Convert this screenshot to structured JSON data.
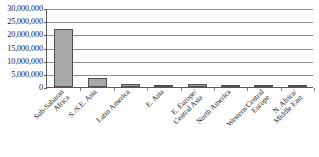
{
  "chart_data": {
    "type": "bar",
    "title": "",
    "subtitle": "",
    "xlabel": "",
    "ylabel": "",
    "categories": [
      "Sub-Saharan Africa",
      "S./S.E. Asia",
      "Latin America",
      "E. Asia",
      "E. Europe/ Central Asia",
      "North America",
      "Western/Central Europe",
      "N. Africa/ Middle East"
    ],
    "category_lines": [
      [
        "Sub-Saharan",
        "Africa"
      ],
      [
        "S./S.E. Asia"
      ],
      [
        "Latin America"
      ],
      [
        "E. Asia"
      ],
      [
        "E. Europe/",
        "Central Asia"
      ],
      [
        "North America"
      ],
      [
        "Western/Central",
        "Europe"
      ],
      [
        "N. Africa/",
        "Middle East"
      ]
    ],
    "values": [
      22000000,
      3500000,
      1200000,
      700000,
      1000000,
      900000,
      600000,
      400000
    ],
    "ylim": [
      0,
      30000000
    ],
    "ytick_values": [
      0,
      5000000,
      10000000,
      15000000,
      20000000,
      25000000,
      30000000
    ],
    "ytick_labels": [
      "0",
      "5,000,000",
      "10,000,000",
      "15,000,000",
      "20,000,000",
      "25,000,000",
      "30,000,000"
    ],
    "grid": true,
    "legend": "none",
    "bar_color": "#a8a8a8",
    "bar_border_color": "#4e4e4e",
    "gridline_color": "#8f8f8f",
    "axis_color": "#5a5a5a",
    "text_color": "#1a1a1a"
  }
}
